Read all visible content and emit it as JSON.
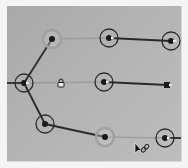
{
  "diagram": {
    "type": "node-link-tree",
    "background": "#b0b0b0",
    "colors": {
      "link_dark": "#2a2a2a",
      "link_faint": "#9e9e9e",
      "ring_dark": "#2a2a2a",
      "ring_faint": "#a0a0a0",
      "node_dot": "#1a1a1a",
      "tip_highlight": "#f2f2f2"
    },
    "nodes": [
      {
        "id": "A",
        "x": 52,
        "y": 39,
        "ring": "faint",
        "tip": false
      },
      {
        "id": "B",
        "x": 109,
        "y": 38,
        "ring": "dark",
        "tip": true
      },
      {
        "id": "C",
        "x": 171,
        "y": 41,
        "ring": "dark",
        "tip": true
      },
      {
        "id": "D",
        "x": 24,
        "y": 83,
        "ring": "dark",
        "tip": true
      },
      {
        "id": "F",
        "x": 104,
        "y": 82,
        "ring": "dark",
        "tip": true
      },
      {
        "id": "G",
        "x": 167,
        "y": 85,
        "ring": "none",
        "tip": true,
        "shape": "square"
      },
      {
        "id": "H",
        "x": 45,
        "y": 124,
        "ring": "dark",
        "tip": false
      },
      {
        "id": "I",
        "x": 105,
        "y": 137,
        "ring": "faint",
        "tip": false
      },
      {
        "id": "J",
        "x": 165,
        "y": 138,
        "ring": "dark",
        "tip": true
      }
    ],
    "links": [
      {
        "from": "edge-left",
        "to": "D",
        "style": "dark"
      },
      {
        "from": "D",
        "to": "A",
        "style": "dark"
      },
      {
        "from": "A",
        "to": "B",
        "style": "faint"
      },
      {
        "from": "B",
        "to": "C",
        "style": "dark"
      },
      {
        "from": "D",
        "to": "F",
        "style": "faint"
      },
      {
        "from": "F",
        "to": "G",
        "style": "dark"
      },
      {
        "from": "D",
        "to": "H",
        "style": "dark"
      },
      {
        "from": "H",
        "to": "I",
        "style": "dark"
      },
      {
        "from": "I",
        "to": "J",
        "style": "faint"
      },
      {
        "from": "J",
        "to": "edge-right",
        "style": "dark"
      }
    ],
    "icons": [
      {
        "name": "lock-icon",
        "x": 61,
        "y": 84
      }
    ],
    "cursor": {
      "x": 135,
      "y": 143,
      "type": "arrow-with-link-icon"
    }
  }
}
